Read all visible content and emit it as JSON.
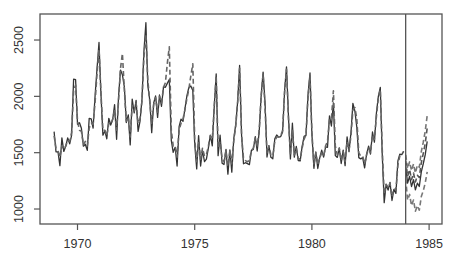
{
  "chart_data": {
    "type": "line",
    "title": "",
    "xlabel": "",
    "ylabel": "",
    "xlim": [
      1968.4,
      1985.55
    ],
    "ylim": [
      867,
      2731
    ],
    "grid": false,
    "x_ticks": [
      1970,
      1975,
      1980,
      1985
    ],
    "x_tick_labels": [
      "1970",
      "1975",
      "1980",
      "1985"
    ],
    "y_ticks": [
      1000,
      1500,
      2000,
      2500
    ],
    "y_tick_labels": [
      "1000",
      "1500",
      "2000",
      "2500"
    ],
    "vline_x": 1984.0,
    "start": 1969.0,
    "frequency": 12,
    "series": [
      {
        "name": "observed",
        "style": "solid",
        "color": "#333333",
        "values": [
          1687,
          1508,
          1507,
          1385,
          1632,
          1511,
          1559,
          1630,
          1579,
          1653,
          2152,
          2148,
          1752,
          1765,
          1717,
          1558,
          1575,
          1520,
          1805,
          1800,
          1719,
          2008,
          2242,
          2478,
          2030,
          1655,
          1693,
          1623,
          1805,
          1746,
          1795,
          1926,
          1619,
          1992,
          2233,
          2192,
          2080,
          1768,
          1835,
          1569,
          1976,
          1853,
          1965,
          1689,
          1778,
          1976,
          2397,
          2654,
          2097,
          1963,
          1677,
          1941,
          2003,
          1813,
          2012,
          1912,
          2084,
          2080,
          2118,
          2150,
          1608,
          1503,
          1548,
          1382,
          1731,
          1798,
          1779,
          1887,
          2004,
          2077,
          2092,
          2051,
          1577,
          1356,
          1652,
          1382,
          1519,
          1421,
          1442,
          1543,
          1656,
          1561,
          1905,
          2199,
          1473,
          1655,
          1407,
          1395,
          1530,
          1309,
          1526,
          1327,
          1627,
          1748,
          1958,
          2274,
          1648,
          1401,
          1411,
          1403,
          1394,
          1520,
          1528,
          1643,
          1515,
          1685,
          2000,
          2215,
          1956,
          1462,
          1563,
          1459,
          1446,
          1622,
          1657,
          1638,
          1643,
          1683,
          2050,
          2262,
          1813,
          1445,
          1762,
          1461,
          1556,
          1431,
          1427,
          1554,
          1645,
          1653,
          2016,
          2207,
          1665,
          1361,
          1506,
          1360,
          1453,
          1522,
          1460,
          1552,
          1548,
          1827,
          1737,
          1941,
          1474,
          1458,
          1542,
          1404,
          1522,
          1385,
          1641,
          1510,
          1681,
          1938,
          1868,
          1726,
          1456,
          1445,
          1456,
          1365,
          1487,
          1558,
          1488,
          1684,
          1594,
          1850,
          1998,
          2079,
          1494,
          1057,
          1218,
          1168,
          1236,
          1076,
          1174,
          1139,
          1427,
          1487,
          1483,
          1513
        ]
      },
      {
        "name": "fitted",
        "style": "dashed",
        "color": "#666666",
        "values": [
          1650,
          1540,
          1520,
          1460,
          1560,
          1530,
          1560,
          1610,
          1600,
          1680,
          2050,
          2100,
          1780,
          1700,
          1690,
          1570,
          1600,
          1560,
          1720,
          1760,
          1750,
          1950,
          2200,
          2420,
          2040,
          1700,
          1700,
          1650,
          1760,
          1750,
          1800,
          1880,
          1700,
          1950,
          2250,
          2380,
          2050,
          1780,
          1820,
          1640,
          1920,
          1870,
          1940,
          1760,
          1800,
          1960,
          2350,
          2550,
          2150,
          1950,
          1760,
          1930,
          1990,
          1860,
          2000,
          1940,
          2080,
          2120,
          2300,
          2440,
          1700,
          1560,
          1560,
          1460,
          1700,
          1760,
          1800,
          1880,
          1980,
          2060,
          2180,
          2290,
          1620,
          1420,
          1600,
          1440,
          1540,
          1470,
          1480,
          1560,
          1650,
          1620,
          1900,
          2180,
          1540,
          1600,
          1450,
          1420,
          1520,
          1380,
          1520,
          1400,
          1610,
          1730,
          1960,
          2250,
          1650,
          1450,
          1430,
          1420,
          1430,
          1520,
          1540,
          1630,
          1560,
          1700,
          1990,
          2200,
          1900,
          1500,
          1560,
          1480,
          1470,
          1600,
          1640,
          1640,
          1650,
          1700,
          2040,
          2240,
          1800,
          1480,
          1700,
          1480,
          1540,
          1450,
          1440,
          1540,
          1620,
          1660,
          1990,
          2180,
          1680,
          1400,
          1500,
          1400,
          1450,
          1500,
          1470,
          1560,
          1600,
          1800,
          1800,
          2050,
          1560,
          1480,
          1540,
          1430,
          1510,
          1420,
          1600,
          1520,
          1650,
          1880,
          1900,
          1800,
          1500,
          1470,
          1470,
          1400,
          1480,
          1540,
          1500,
          1660,
          1620,
          1820,
          1980,
          2060,
          1540,
          1130,
          1220,
          1190,
          1230,
          1110,
          1180,
          1170,
          1390,
          1470,
          1490,
          1510
        ]
      },
      {
        "name": "forecast",
        "style": "solid",
        "color": "#333333",
        "start": 1984.0,
        "values": [
          1380,
          1230,
          1290,
          1200,
          1260,
          1170,
          1230,
          1200,
          1330,
          1400,
          1480,
          1600
        ]
      },
      {
        "name": "forecast_upper",
        "style": "dashed",
        "color": "#777777",
        "start": 1984.0,
        "values": [
          1480,
          1360,
          1420,
          1340,
          1400,
          1320,
          1390,
          1370,
          1510,
          1590,
          1690,
          1830
        ]
      },
      {
        "name": "forecast_lower",
        "style": "dashed",
        "color": "#777777",
        "start": 1984.0,
        "values": [
          1270,
          1080,
          1130,
          1030,
          1080,
          980,
          1030,
          990,
          1110,
          1160,
          1230,
          1330
        ]
      },
      {
        "name": "forecast_alt",
        "style": "dashed",
        "color": "#555555",
        "start": 1984.0,
        "values": [
          1430,
          1290,
          1350,
          1260,
          1320,
          1240,
          1300,
          1280,
          1410,
          1490,
          1580,
          1720
        ]
      }
    ]
  }
}
